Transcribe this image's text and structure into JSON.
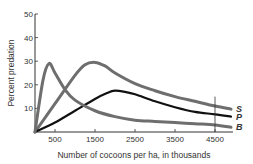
{
  "chart_data": {
    "type": "line",
    "title": "",
    "xlabel": "Number of cocoons per ha, in thousands",
    "ylabel": "Percent predation",
    "xlim": [
      0,
      4950
    ],
    "ylim": [
      0,
      50
    ],
    "x_ticks": [
      500,
      1500,
      2500,
      3500,
      4500
    ],
    "x_tick_labels": [
      "500",
      "1500",
      "2500",
      "3500",
      "4500"
    ],
    "y_ticks": [
      10,
      20,
      30,
      40,
      50
    ],
    "y_tick_labels": [
      "10",
      "20",
      "30",
      "40",
      "50"
    ],
    "grid": false,
    "legend": "inline labels at right end of curves",
    "annotations": [
      {
        "type": "vertical-line",
        "x": 4500
      }
    ],
    "series": [
      {
        "name": "S",
        "color": "#6e6e6e",
        "x": [
          0,
          500,
          1000,
          1250,
          1500,
          1750,
          2000,
          2500,
          3000,
          3500,
          4000,
          4500,
          4900
        ],
        "values": [
          0,
          12,
          24,
          28.5,
          29.5,
          28,
          25,
          20.5,
          17.5,
          15,
          13,
          11,
          9.7
        ]
      },
      {
        "name": "P",
        "color": "#111111",
        "x": [
          0,
          500,
          1000,
          1500,
          1800,
          2000,
          2250,
          2500,
          3000,
          3500,
          4000,
          4500,
          4900
        ],
        "values": [
          0,
          4,
          9,
          14,
          16.5,
          17.5,
          17,
          16,
          13,
          10.5,
          8.5,
          7.5,
          6.5
        ]
      },
      {
        "name": "B",
        "color": "#6e6e6e",
        "x": [
          0,
          200,
          350,
          500,
          750,
          1000,
          1500,
          2000,
          2500,
          3000,
          3500,
          4000,
          4500,
          4900
        ],
        "values": [
          0,
          22,
          29,
          25,
          18,
          13.5,
          9,
          6.5,
          5,
          4.5,
          4,
          3.5,
          3,
          2
        ]
      }
    ]
  },
  "labels": {
    "series_s": "S",
    "series_p": "P",
    "series_b": "B",
    "xlabel": "Number of cocoons per ha, in thousands",
    "ylabel": "Percent predation"
  }
}
